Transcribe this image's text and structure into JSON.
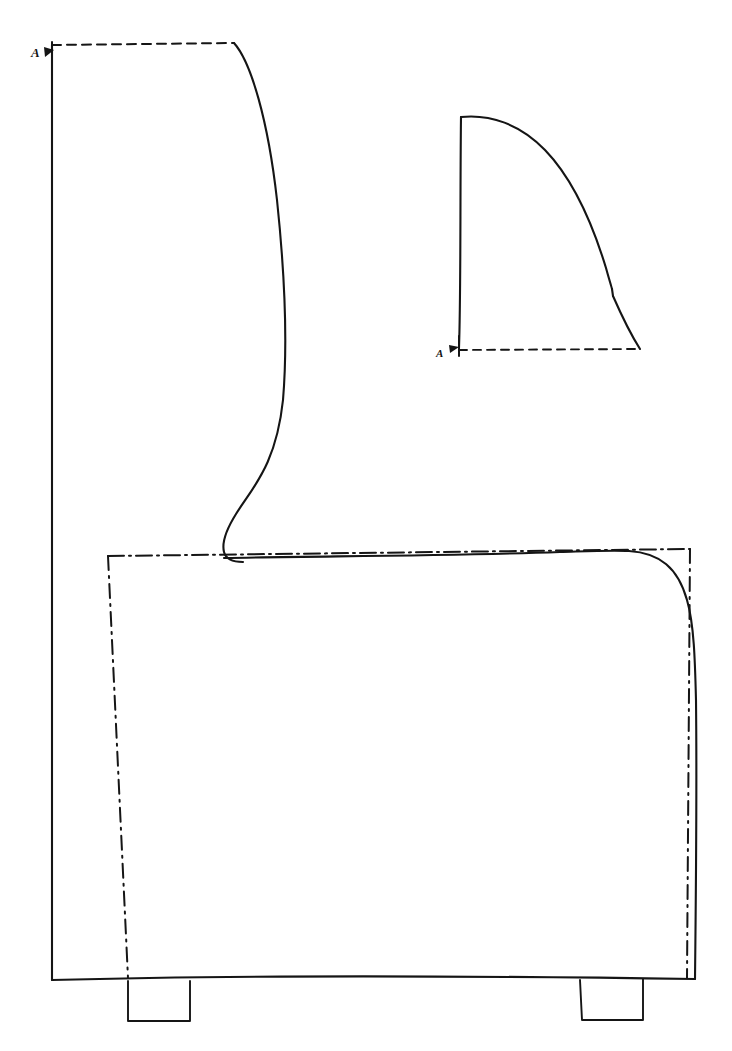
{
  "document": {
    "kind": "technical-drawing",
    "medium": "hand-drawn ink on white paper",
    "sheet_width": 732,
    "sheet_height": 1051,
    "background_color": "#ffffff",
    "ink_color": "#151515",
    "title": "Armchair side elevation with section A-A"
  },
  "labels": {
    "section_mark_top_left": "A",
    "section_mark_section_view": "A"
  },
  "views": [
    {
      "id": "side-elevation",
      "name": "Side elevation of upholstered armchair",
      "description": "Large left view: vertical back edge, dashed top line, S-curved front face of backrest, long horizontal seat line, rounded front arm corner, two rectangular feet"
    },
    {
      "id": "section-a-a",
      "name": "Section A-A profile",
      "description": "Upper right view: quarter-round backrest cross-section, straight left edge, convex curved top-right flank with a notch, dashed horizontal base line"
    }
  ],
  "geometry": {
    "elevation": {
      "top_hidden_line": "M 52 45 L 234 43",
      "back_edge": "M 52 45 C 51 300, 53 640, 52 980",
      "back_curve": "M 234 43 C 251 62, 268 120, 277 200 C 285 276, 288 340, 283 400 C 276 466, 252 488, 236 514 C 226 530, 222 544, 224 552 C 226 560, 233 562, 243 562",
      "seat_line": "M 224 558 C 330 556, 450 556, 560 552 C 592 551, 612 550, 629 551",
      "front_round_corner": "M 629 551 C 660 553, 678 568, 687 600 C 694 624, 695 660, 696 700",
      "front_edge": "M 696 700 C 697 790, 696 890, 695 979",
      "base_line": "M 52 980 C 200 976, 420 975, 695 979",
      "foot_left": "M 128 981 L 128 1021 L 190 1021 L 190 981",
      "foot_right": "M 580 980 L 582 1020 L 643 1020 L 643 979"
    },
    "construction": {
      "seat_box_top": "M 108 556 L 690 549",
      "seat_box_left": "M 108 556 L 128 978",
      "seat_box_right": "M 690 549 L 687 978"
    },
    "section": {
      "left_edge": "M 461 117 C 460 200, 461 290, 459 348",
      "top_curve": "M 461 117 C 490 114, 520 124, 545 150 C 572 178, 592 222, 606 268 C 609 279, 611 285, 612 289",
      "notch": "M 612 289 L 613 296",
      "lower_flank": "M 613 296 C 620 312, 628 330, 640 349",
      "base_hidden_line": "M 459 350 L 640 349"
    }
  },
  "line_types": {
    "outline": "continuous thick",
    "hidden": "dashed",
    "center": "dash-dot"
  }
}
